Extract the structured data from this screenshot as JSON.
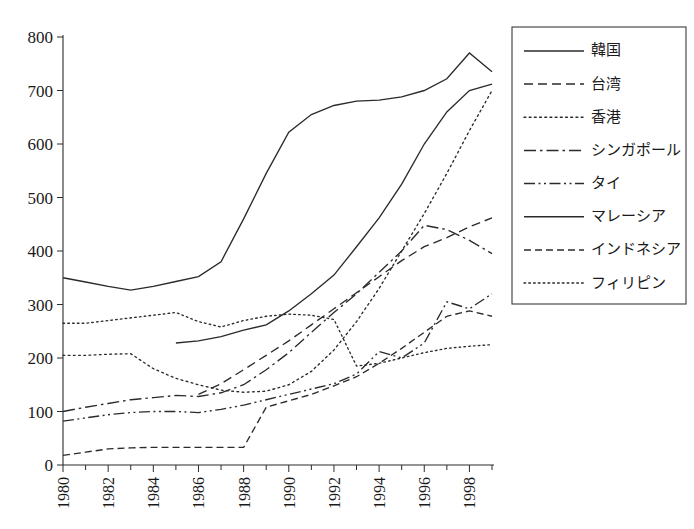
{
  "chart_data": {
    "type": "line",
    "title": "",
    "xlabel": "",
    "ylabel": "",
    "xlim": [
      1980,
      1999
    ],
    "ylim": [
      0,
      800
    ],
    "grid": false,
    "legend_position": "right",
    "y_ticks": [
      "0",
      "100",
      "200",
      "300",
      "400",
      "500",
      "600",
      "700",
      "800"
    ],
    "y_tick_values": [
      0,
      100,
      200,
      300,
      400,
      500,
      600,
      700,
      800
    ],
    "x_ticks": [
      "1980",
      "1982",
      "1984",
      "1986",
      "1988",
      "1990",
      "1992",
      "1994",
      "1996",
      "1998"
    ],
    "x_tick_values": [
      1980,
      1982,
      1984,
      1986,
      1988,
      1990,
      1992,
      1994,
      1996,
      1998
    ],
    "x_minor_ticks": [
      1981,
      1983,
      1985,
      1987,
      1989,
      1991,
      1993,
      1995,
      1997,
      1999
    ],
    "series": [
      {
        "name": "韓国",
        "dash": "none",
        "x": [
          1985,
          1986,
          1987,
          1988,
          1989,
          1990,
          1991,
          1992,
          1993,
          1994,
          1995,
          1996,
          1997,
          1998,
          1999
        ],
        "values": [
          228,
          232,
          240,
          252,
          262,
          288,
          320,
          355,
          408,
          462,
          525,
          600,
          660,
          700,
          712
        ]
      },
      {
        "name": "台湾",
        "dash": "dashed",
        "x": [
          1986,
          1987,
          1988,
          1989,
          1990,
          1991,
          1992,
          1993,
          1994,
          1995,
          1996,
          1997,
          1998,
          1999
        ],
        "values": [
          132,
          152,
          178,
          205,
          232,
          262,
          292,
          322,
          352,
          382,
          408,
          425,
          445,
          462
        ]
      },
      {
        "name": "香港",
        "dash": "dotted",
        "x": [
          1980,
          1981,
          1982,
          1983,
          1984,
          1985,
          1986,
          1987,
          1988,
          1989,
          1990,
          1991,
          1992,
          1993,
          1994,
          1995,
          1996,
          1997,
          1998,
          1999
        ],
        "values": [
          205,
          205,
          207,
          208,
          180,
          162,
          150,
          140,
          136,
          138,
          150,
          175,
          215,
          268,
          330,
          400,
          470,
          545,
          625,
          700
        ]
      },
      {
        "name": "シンガポール",
        "dash": "dashdot",
        "x": [
          1980,
          1981,
          1982,
          1983,
          1984,
          1985,
          1986,
          1987,
          1988,
          1989,
          1990,
          1991,
          1992,
          1993,
          1994,
          1995,
          1996,
          1997,
          1998,
          1999
        ],
        "values": [
          100,
          108,
          115,
          122,
          126,
          130,
          128,
          135,
          150,
          178,
          210,
          248,
          285,
          320,
          360,
          400,
          448,
          440,
          420,
          395
        ]
      },
      {
        "name": "タイ",
        "dash": "dashdotdot",
        "x": [
          1980,
          1981,
          1982,
          1983,
          1984,
          1985,
          1986,
          1987,
          1988,
          1989,
          1990,
          1991,
          1992,
          1993,
          1994,
          1995,
          1996,
          1997,
          1998,
          1999
        ],
        "values": [
          82,
          88,
          94,
          98,
          100,
          100,
          98,
          104,
          112,
          122,
          132,
          142,
          152,
          170,
          212,
          200,
          228,
          305,
          292,
          320
        ]
      },
      {
        "name": "マレーシア",
        "dash": "none",
        "x": [
          1980,
          1981,
          1982,
          1983,
          1984,
          1985,
          1986,
          1987,
          1988,
          1989,
          1990,
          1991,
          1992,
          1993,
          1994,
          1995,
          1996,
          1997,
          1998,
          1999
        ],
        "values": [
          350,
          342,
          334,
          327,
          334,
          343,
          352,
          380,
          460,
          545,
          622,
          655,
          672,
          680,
          682,
          688,
          700,
          722,
          770,
          735
        ]
      },
      {
        "name": "インドネシア",
        "dash": "dashed-sm",
        "x": [
          1980,
          1981,
          1982,
          1983,
          1984,
          1985,
          1986,
          1987,
          1988,
          1989,
          1990,
          1991,
          1992,
          1993,
          1994,
          1995,
          1996,
          1997,
          1998,
          1999
        ],
        "values": [
          18,
          24,
          30,
          32,
          33,
          33,
          33,
          33,
          33,
          108,
          120,
          132,
          148,
          165,
          190,
          218,
          248,
          278,
          288,
          278
        ]
      },
      {
        "name": "フィリピン",
        "dash": "dotted-sm",
        "x": [
          1980,
          1981,
          1985,
          1986,
          1987,
          1988,
          1989,
          1990,
          1991,
          1992,
          1993,
          1994,
          1995,
          1996,
          1997,
          1998,
          1999
        ],
        "values": [
          265,
          265,
          285,
          268,
          258,
          270,
          278,
          282,
          280,
          272,
          185,
          190,
          200,
          210,
          218,
          222,
          225
        ]
      }
    ]
  },
  "legend": {
    "items": [
      {
        "label": "韓国",
        "style": "solid"
      },
      {
        "label": "台湾",
        "style": "dashed"
      },
      {
        "label": "香港",
        "style": "dotted"
      },
      {
        "label": "シンガポール",
        "style": "dashdot"
      },
      {
        "label": "タイ",
        "style": "dashdotdot"
      },
      {
        "label": "マレーシア",
        "style": "solid"
      },
      {
        "label": "インドネシア",
        "style": "dashed"
      },
      {
        "label": "フィリピン",
        "style": "dotted"
      }
    ]
  },
  "colors": {
    "ink": "#2b2b2b",
    "background": "#ffffff",
    "legend_border": "#3a3a3a"
  }
}
